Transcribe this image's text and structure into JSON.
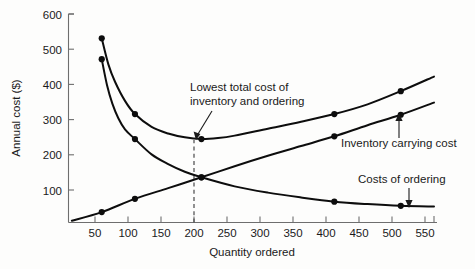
{
  "chart_data": {
    "type": "line",
    "title": "",
    "xlabel": "Quantity ordered",
    "ylabel": "Annual cost ($)",
    "xlim": [
      0,
      550
    ],
    "ylim": [
      0,
      600
    ],
    "xticks": [
      50,
      100,
      150,
      200,
      250,
      300,
      350,
      400,
      450,
      500,
      550
    ],
    "yticks": [
      100,
      200,
      300,
      400,
      500,
      600
    ],
    "grid": false,
    "legend": "inline-annotations",
    "series": [
      {
        "name": "Total cost of inventory and ordering",
        "marker_x": [
          50,
          100,
          200,
          400,
          500
        ],
        "marker_y": [
          530,
          312,
          240,
          312,
          378
        ],
        "curve": [
          [
            50,
            530
          ],
          [
            60,
            455
          ],
          [
            70,
            405
          ],
          [
            85,
            350
          ],
          [
            100,
            312
          ],
          [
            125,
            275
          ],
          [
            150,
            256
          ],
          [
            175,
            245
          ],
          [
            200,
            240
          ],
          [
            225,
            243
          ],
          [
            250,
            250
          ],
          [
            300,
            270
          ],
          [
            350,
            290
          ],
          [
            400,
            312
          ],
          [
            450,
            340
          ],
          [
            500,
            378
          ],
          [
            550,
            420
          ]
        ]
      },
      {
        "name": "Inventory carrying cost",
        "marker_x": [
          50,
          100,
          200,
          400,
          500
        ],
        "marker_y": [
          30,
          68,
          130,
          248,
          310
        ],
        "curve": [
          [
            5,
            5
          ],
          [
            50,
            30
          ],
          [
            100,
            68
          ],
          [
            150,
            99
          ],
          [
            200,
            130
          ],
          [
            250,
            162
          ],
          [
            300,
            192
          ],
          [
            350,
            220
          ],
          [
            400,
            248
          ],
          [
            450,
            280
          ],
          [
            500,
            310
          ],
          [
            550,
            345
          ]
        ]
      },
      {
        "name": "Costs of ordering",
        "marker_x": [
          50,
          100,
          200,
          400,
          500
        ],
        "marker_y": [
          470,
          240,
          130,
          60,
          48
        ],
        "curve": [
          [
            50,
            470
          ],
          [
            58,
            395
          ],
          [
            66,
            342
          ],
          [
            75,
            300
          ],
          [
            85,
            268
          ],
          [
            100,
            240
          ],
          [
            125,
            196
          ],
          [
            150,
            168
          ],
          [
            175,
            146
          ],
          [
            200,
            130
          ],
          [
            250,
            104
          ],
          [
            300,
            86
          ],
          [
            350,
            72
          ],
          [
            400,
            60
          ],
          [
            450,
            53
          ],
          [
            500,
            48
          ],
          [
            550,
            46
          ]
        ]
      }
    ],
    "annotations": [
      {
        "name": "lowest-total-cost",
        "lines": [
          "Lowest total cost of",
          "inventory and ordering"
        ],
        "points_to": [
          200,
          240
        ]
      },
      {
        "name": "inventory-carrying-cost",
        "lines": [
          "Inventory carrying cost"
        ],
        "points_to": [
          480,
          290
        ]
      },
      {
        "name": "costs-of-ordering",
        "lines": [
          "Costs of ordering"
        ],
        "points_to": [
          525,
          50
        ]
      }
    ],
    "guides": [
      {
        "name": "optimum-quantity-dashed",
        "x": 200,
        "from_y": 0,
        "to_y": 240
      }
    ]
  },
  "labels": {
    "y_axis_title": "Annual cost ($)",
    "x_axis_title": "Quantity ordered",
    "y_600": "600",
    "y_500": "500",
    "y_400": "400",
    "y_300": "300",
    "y_200": "200",
    "y_100": "100",
    "x_50": "50",
    "x_100": "100",
    "x_150": "150",
    "x_200": "200",
    "x_250": "250",
    "x_300": "300",
    "x_350": "350",
    "x_400": "400",
    "x_450": "450",
    "x_500": "500",
    "x_550": "550",
    "anno_lowest_1": "Lowest total cost of",
    "anno_lowest_2": "inventory and ordering",
    "anno_carrying": "Inventory carrying cost",
    "anno_ordering": "Costs of ordering"
  },
  "colors": {
    "line": "#0d0d0d",
    "axis": "#6e6e6e",
    "text": "#1a1a1a",
    "dashed": "#4a4a4a",
    "background": "#fdfdfc"
  }
}
